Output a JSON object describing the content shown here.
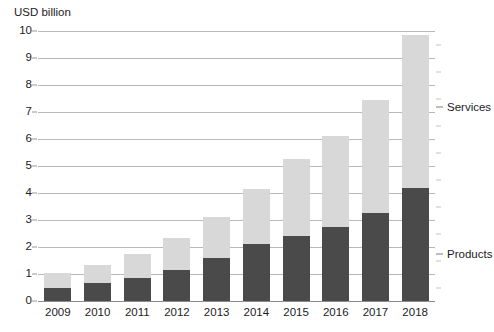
{
  "chart_data": {
    "type": "bar",
    "subtype": "stacked-vertical",
    "title": "",
    "subtitle": "",
    "xlabel": "",
    "ylabel": "USD billion",
    "axis_caption": "USD billion",
    "ylim": [
      0,
      10
    ],
    "ytick_values": [
      0,
      1,
      2,
      3,
      4,
      5,
      6,
      7,
      8,
      9,
      10
    ],
    "ytick_labels": [
      "0",
      "1",
      "2",
      "3",
      "4",
      "5",
      "6",
      "7",
      "8",
      "9",
      "10"
    ],
    "grid": true,
    "grid_axis": "y",
    "legend_position": "right-inline-callout",
    "categories": [
      "2009",
      "2010",
      "2011",
      "2012",
      "2013",
      "2014",
      "2015",
      "2016",
      "2017",
      "2018"
    ],
    "series": [
      {
        "name": "Products",
        "color": "#4a4a4a",
        "values": [
          0.5,
          0.65,
          0.85,
          1.15,
          1.6,
          2.1,
          2.4,
          2.75,
          3.25,
          4.2
        ]
      },
      {
        "name": "Services",
        "color": "#d8d8d8",
        "values": [
          0.55,
          0.7,
          0.9,
          1.2,
          1.5,
          2.05,
          2.85,
          3.35,
          4.2,
          5.65
        ]
      }
    ],
    "totals": [
      1.05,
      1.35,
      1.75,
      2.35,
      3.1,
      4.15,
      5.25,
      6.1,
      7.45,
      9.85
    ],
    "callouts": [
      {
        "label": "Services",
        "value_axis": 7.2
      },
      {
        "label": "Products",
        "value_axis": 1.75
      }
    ]
  }
}
